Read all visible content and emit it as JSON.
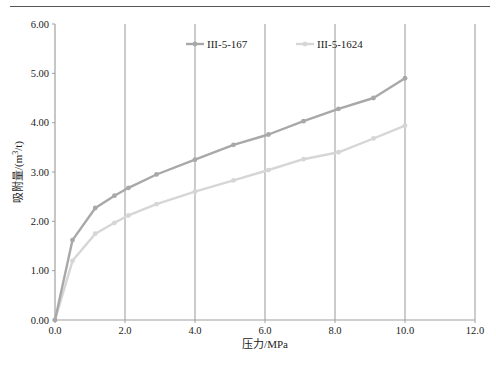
{
  "chart_data": {
    "type": "line",
    "title": "",
    "xlabel": "压力/MPa",
    "ylabel": "吸附量/(m³/t)",
    "ylabel_parts": {
      "prefix": "吸附量/(m",
      "sup": "3",
      "suffix": "/t)"
    },
    "xlim": [
      0,
      12
    ],
    "ylim": [
      0,
      6
    ],
    "x_ticks": [
      "0.0",
      "2.0",
      "4.0",
      "6.0",
      "8.0",
      "10.0",
      "12.0"
    ],
    "y_ticks": [
      "0.00",
      "1.00",
      "2.00",
      "3.00",
      "4.00",
      "5.00",
      "6.00"
    ],
    "grid": {
      "vertical": true,
      "horizontal": false
    },
    "legend_position": "top-inside",
    "series": [
      {
        "name": "III-5-167",
        "color": "#a8a8a8",
        "x": [
          0,
          0.5,
          1.15,
          1.7,
          2.1,
          2.9,
          4.0,
          5.1,
          6.1,
          7.1,
          8.1,
          9.1,
          10.0
        ],
        "values": [
          0,
          1.62,
          2.27,
          2.52,
          2.68,
          2.95,
          3.25,
          3.55,
          3.76,
          4.03,
          4.28,
          4.5,
          4.9
        ]
      },
      {
        "name": "III-5-1624",
        "color": "#d6d6d6",
        "x": [
          0,
          0.5,
          1.15,
          1.7,
          2.1,
          2.9,
          4.0,
          5.1,
          6.1,
          7.1,
          8.1,
          9.1,
          10.0
        ],
        "values": [
          0,
          1.2,
          1.75,
          1.97,
          2.12,
          2.35,
          2.6,
          2.83,
          3.04,
          3.26,
          3.4,
          3.68,
          3.94
        ]
      }
    ]
  }
}
